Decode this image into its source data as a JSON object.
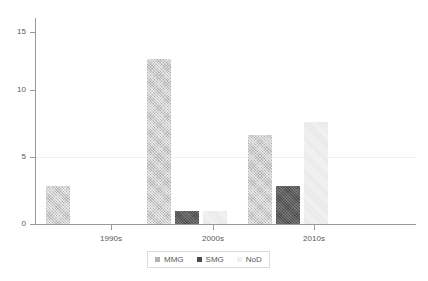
{
  "chart_data": {
    "type": "bar",
    "title": "",
    "subtitle": "",
    "xlabel": "",
    "ylabel": "",
    "categories": [
      "1990s",
      "2000s",
      "2010s"
    ],
    "series": [
      {
        "name": "MMG",
        "values": [
          3,
          13,
          7
        ],
        "color": "#b3b3b3"
      },
      {
        "name": "SMG",
        "values": [
          0,
          1,
          3
        ],
        "color": "#4a4a4a"
      },
      {
        "name": "NoD",
        "values": [
          0,
          1,
          8
        ],
        "color": "#f0f0f0"
      }
    ],
    "ylim": [
      0,
      16.2
    ],
    "yticks": [
      0,
      5,
      10,
      15
    ],
    "ytick_labels": [
      "0",
      "5",
      "10",
      "15"
    ],
    "xtick_labels": [
      "1990s",
      "2000s",
      "2010s"
    ],
    "grid": true,
    "gridlines_at": [
      5
    ],
    "legend_position": "bottom-center",
    "legend_entries": [
      "MMG",
      "SMG",
      "NoD"
    ]
  },
  "axis": {
    "y": {
      "ticks": [
        {
          "label": "15",
          "value": 15
        },
        {
          "label": "10",
          "value": 10
        },
        {
          "label": "5",
          "value": 5
        },
        {
          "label": "0",
          "value": 0
        }
      ]
    },
    "x": {
      "ticks": [
        {
          "label": "1990s"
        },
        {
          "label": "2000s"
        },
        {
          "label": "2010s"
        }
      ]
    }
  },
  "legend": {
    "items": [
      {
        "label": "MMG",
        "swatch": "mmg-swatch-icon"
      },
      {
        "label": "SMG",
        "swatch": "smg-swatch-icon"
      },
      {
        "label": "NoD",
        "swatch": "nod-swatch-icon"
      }
    ]
  }
}
